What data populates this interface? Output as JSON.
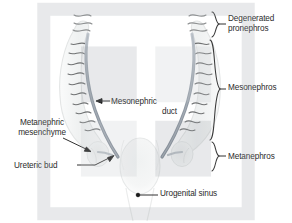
{
  "figure": {
    "background_color": "#ffffff",
    "text_color": "#2b2b2b",
    "duct_color": "#8a93a0",
    "tubule_color": "#6e6e6e",
    "body_fill_color": "#f2f3f3",
    "body_stroke_color": "#e2e4e4",
    "leader_color": "#1a1a1a",
    "brace_color": "#3a3a3a"
  },
  "labels": {
    "degenerated_pronephros_line1": "Degenerated",
    "degenerated_pronephros_line2": "pronephros",
    "mesonephros": "Mesonephros",
    "metanephros": "Metanephros",
    "mesonephric_duct_line1": "Mesonephric",
    "mesonephric_duct_line2": "duct",
    "metanephric_mesenchyme_line1": "Metanephric",
    "metanephric_mesenchyme_line2": "mesenchyme",
    "ureteric_bud": "Ureteric bud",
    "urogenital_sinus": "Urogenital sinus"
  },
  "braces": [
    {
      "name": "degenerated-pronephros",
      "label": "Degenerated pronephros",
      "y_top": 12,
      "y_bottom": 38
    },
    {
      "name": "mesonephros",
      "label": "Mesonephros",
      "y_top": 40,
      "y_bottom": 140
    },
    {
      "name": "metanephros",
      "label": "Metanephros",
      "y_top": 142,
      "y_bottom": 172
    }
  ],
  "structures": [
    {
      "name": "degenerated-pronephros-left",
      "kind": "wavy-tubule-cluster",
      "side": "left"
    },
    {
      "name": "degenerated-pronephros-right",
      "kind": "wavy-tubule-cluster",
      "side": "right"
    },
    {
      "name": "mesonephros-left",
      "kind": "elongated-body",
      "side": "left"
    },
    {
      "name": "mesonephros-right",
      "kind": "elongated-body",
      "side": "right"
    },
    {
      "name": "mesonephric-duct-left",
      "kind": "duct",
      "side": "left"
    },
    {
      "name": "mesonephric-duct-right",
      "kind": "duct",
      "side": "right"
    },
    {
      "name": "metanephric-mesenchyme-left",
      "kind": "oval-blob",
      "side": "left"
    },
    {
      "name": "metanephric-mesenchyme-right",
      "kind": "oval-blob",
      "side": "right"
    },
    {
      "name": "ureteric-bud-left",
      "kind": "bud",
      "side": "left"
    },
    {
      "name": "ureteric-bud-right",
      "kind": "bud",
      "side": "right"
    },
    {
      "name": "urogenital-sinus",
      "kind": "central-oval",
      "side": "center"
    }
  ]
}
